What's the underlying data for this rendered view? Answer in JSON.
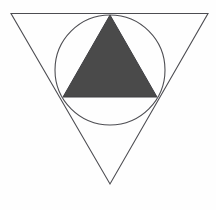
{
  "figure": {
    "title": "Geometric composition: inverted triangle, circle, and shaded triangle",
    "canvas": {
      "width": 216,
      "height": 210,
      "background_color": "#fefefe"
    },
    "shapes": {
      "outer_triangle": {
        "name": "inverted-outline-triangle",
        "orientation": "point-down",
        "fill": "none",
        "stroke_color": "#4d4d52",
        "stroke_width": 1.1,
        "points": "11,13.5 208,13.5 110,184"
      },
      "circle": {
        "name": "inscribed-circle",
        "fill": "none",
        "stroke_color": "#4d4d52",
        "stroke_width": 1.1,
        "center_x": 110,
        "center_y": 70,
        "radius": 55
      },
      "inner_triangle": {
        "name": "shaded-upright-triangle",
        "orientation": "point-up",
        "fill_color": "#4a4a4a",
        "stroke_color": "#3f3f43",
        "stroke_width": 1,
        "points": "110,15 157,97 63,97"
      }
    }
  }
}
